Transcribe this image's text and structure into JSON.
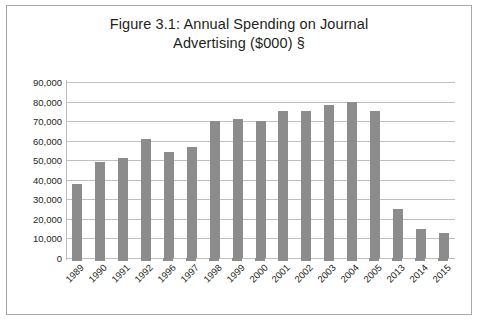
{
  "figure": {
    "title_line_1": "Figure 3.1: Annual Spending on Journal",
    "title_line_2": "Advertising ($000) §",
    "border_color": "#a9a9a9",
    "background_color": "#ffffff"
  },
  "chart_data": {
    "type": "bar",
    "title": "Figure 3.1: Annual Spending on Journal Advertising ($000) §",
    "xlabel": "",
    "ylabel": "",
    "categories": [
      "1989",
      "1990",
      "1991",
      "1992",
      "1996",
      "1997",
      "1998",
      "1999",
      "2000",
      "2001",
      "2002",
      "2003",
      "2004",
      "2005",
      "2013",
      "2014",
      "2015"
    ],
    "values": [
      38000,
      49000,
      51000,
      61000,
      54000,
      57000,
      70000,
      71000,
      70000,
      75000,
      75000,
      78000,
      80000,
      75000,
      25000,
      15000,
      13000
    ],
    "ylim": [
      0,
      90000
    ],
    "ytick_values": [
      0,
      10000,
      20000,
      30000,
      40000,
      50000,
      60000,
      70000,
      80000,
      90000
    ],
    "ytick_labels": [
      "0",
      "10,000",
      "20,000",
      "30,000",
      "40,000",
      "50,000",
      "60,000",
      "70,000",
      "80,000",
      "90,000"
    ],
    "grid": true,
    "legend": null,
    "bar_color": "#8c8c8c",
    "gridline_color": "#bfbfbf"
  }
}
